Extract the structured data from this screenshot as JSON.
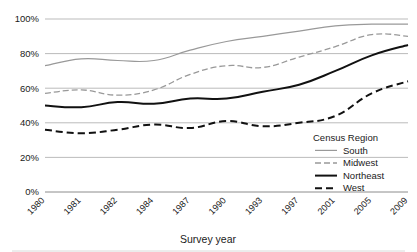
{
  "chart_data": {
    "type": "line",
    "title": "",
    "xlabel": "Survey year",
    "ylabel": "",
    "categories": [
      "1980",
      "1981",
      "1982",
      "1984",
      "1987",
      "1990",
      "1993",
      "1997",
      "2001",
      "2005",
      "2009"
    ],
    "ylim": [
      0,
      100
    ],
    "ytick_labels": [
      "0%",
      "20%",
      "40%",
      "60%",
      "80%",
      "100%"
    ],
    "ytick_values": [
      0,
      20,
      40,
      60,
      80,
      100
    ],
    "grid": "horizontal",
    "legend_position": "inside-bottom-right",
    "legend_title": "Census Region",
    "series": [
      {
        "name": "South",
        "style": "solid-thin",
        "color": "#999999",
        "width": 1.2,
        "dash": "none",
        "values": [
          73,
          77,
          76,
          76,
          82,
          87,
          90,
          93,
          96,
          97,
          97
        ]
      },
      {
        "name": "Midwest",
        "style": "dashed-thin",
        "color": "#999999",
        "width": 1.3,
        "dash": "6,3",
        "values": [
          57,
          59,
          56,
          59,
          68,
          73,
          72,
          78,
          84,
          91,
          90
        ]
      },
      {
        "name": "Northeast",
        "style": "solid-bold",
        "color": "#111111",
        "width": 2.0,
        "dash": "none",
        "values": [
          50,
          49,
          52,
          51,
          54,
          54,
          58,
          62,
          70,
          79,
          85
        ]
      },
      {
        "name": "West",
        "style": "dashed-bold",
        "color": "#111111",
        "width": 2.0,
        "dash": "7,4",
        "values": [
          36,
          34,
          36,
          39,
          37,
          41,
          38,
          40,
          44,
          57,
          64
        ]
      }
    ]
  },
  "axis": {
    "x_title": "Survey year"
  },
  "legend": {
    "title": "Census Region",
    "items": [
      {
        "label": "South"
      },
      {
        "label": "Midwest"
      },
      {
        "label": "Northeast"
      },
      {
        "label": "West"
      }
    ]
  },
  "colors": {
    "gray_series": "#999999",
    "black_series": "#111111",
    "gridline": "#b3b3b3",
    "text": "#1a1a1a",
    "background": "#ffffff"
  }
}
